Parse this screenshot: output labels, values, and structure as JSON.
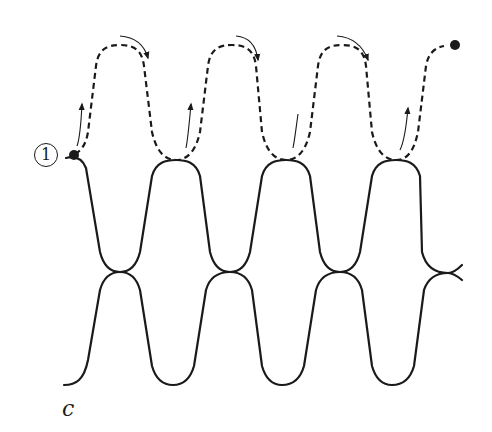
{
  "figure": {
    "panel_label": "c",
    "start_marker_label": "1",
    "colors": {
      "stroke": "#1a1a1a",
      "background": "#ffffff"
    },
    "elements": {
      "upper_solid_curve": "wavy line with 4 upward loops touching dashed path",
      "lower_solid_curve": "wavy line mirrored below, touching upper curve at crossings",
      "dashed_path": "threading path starting at marker 1 and ending at filled dot",
      "direction_arrows": 8
    }
  }
}
